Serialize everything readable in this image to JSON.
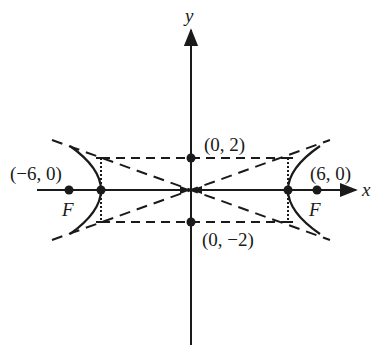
{
  "diagram": {
    "type": "hyperbola",
    "axes": {
      "x_label": "x",
      "y_label": "y"
    },
    "foci": [
      {
        "coord_label": "(-6, 0)",
        "name_label": "F",
        "x": -6,
        "y": 0
      },
      {
        "coord_label": "(6, 0)",
        "name_label": "F",
        "x": 6,
        "y": 0
      }
    ],
    "co_vertices": [
      {
        "coord_label": "(0, 2)",
        "x": 0,
        "y": 2
      },
      {
        "coord_label": "(0, −2)",
        "x": 0,
        "y": -2
      }
    ],
    "labels": {
      "left_focus": "(−6, 0)",
      "right_focus": "(6, 0)",
      "top_covertex": "(0, 2)",
      "bottom_covertex": "(0, −2)",
      "focus_letter": "F"
    },
    "colors": {
      "stroke": "#1a1a1a",
      "background": "#ffffff"
    }
  }
}
